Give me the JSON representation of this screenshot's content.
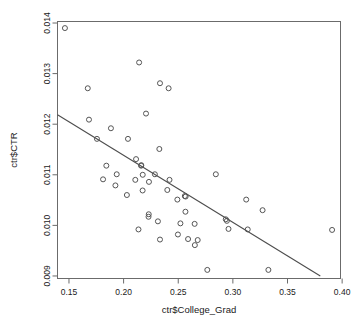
{
  "chart_data": {
    "type": "scatter",
    "title": "",
    "xlabel": "ctr$College_Grad",
    "ylabel": "ctr$CTR",
    "xlim": [
      0.1395,
      0.3985
    ],
    "ylim": [
      0.00895,
      0.01403
    ],
    "xticks": [
      0.15,
      0.2,
      0.25,
      0.3,
      0.35,
      0.4
    ],
    "xtick_labels": [
      "0.15",
      "0.20",
      "0.25",
      "0.30",
      "0.35",
      "0.40"
    ],
    "yticks": [
      0.009,
      0.01,
      0.011,
      0.012,
      0.013,
      0.014
    ],
    "ytick_labels": [
      "0.009",
      "0.010",
      "0.011",
      "0.012",
      "0.013",
      "0.014"
    ],
    "grid": false,
    "legend": null,
    "marker": "open-circle",
    "marker_color": "#555555",
    "point_count": 62,
    "points": [
      [
        0.1463,
        0.0139
      ],
      [
        0.2142,
        0.01322
      ],
      [
        0.1672,
        0.01271
      ],
      [
        0.2333,
        0.01281
      ],
      [
        0.2412,
        0.01271
      ],
      [
        0.2205,
        0.01221
      ],
      [
        0.1683,
        0.01209
      ],
      [
        0.1884,
        0.01192
      ],
      [
        0.1756,
        0.01171
      ],
      [
        0.204,
        0.01171
      ],
      [
        0.2327,
        0.01151
      ],
      [
        0.2114,
        0.01131
      ],
      [
        0.1842,
        0.01118
      ],
      [
        0.2162,
        0.01119
      ],
      [
        0.216,
        0.01118
      ],
      [
        0.1937,
        0.01101
      ],
      [
        0.2175,
        0.011
      ],
      [
        0.2286,
        0.01101
      ],
      [
        0.2844,
        0.01101
      ],
      [
        0.1812,
        0.01091
      ],
      [
        0.2107,
        0.0109
      ],
      [
        0.2232,
        0.01086
      ],
      [
        0.242,
        0.0109
      ],
      [
        0.1925,
        0.01079
      ],
      [
        0.24,
        0.0107
      ],
      [
        0.2174,
        0.01069
      ],
      [
        0.203,
        0.0106
      ],
      [
        0.256,
        0.01058
      ],
      [
        0.2568,
        0.01057
      ],
      [
        0.3122,
        0.01051
      ],
      [
        0.2492,
        0.01051
      ],
      [
        0.3272,
        0.0103
      ],
      [
        0.2566,
        0.01027
      ],
      [
        0.223,
        0.01022
      ],
      [
        0.2228,
        0.01017
      ],
      [
        0.2935,
        0.01012
      ],
      [
        0.2945,
        0.01009
      ],
      [
        0.2314,
        0.01008
      ],
      [
        0.252,
        0.01004
      ],
      [
        0.265,
        0.01003
      ],
      [
        0.2136,
        0.00992
      ],
      [
        0.296,
        0.00993
      ],
      [
        0.3136,
        0.00992
      ],
      [
        0.3908,
        0.00991
      ],
      [
        0.2497,
        0.00982
      ],
      [
        0.259,
        0.00973
      ],
      [
        0.2333,
        0.00972
      ],
      [
        0.2678,
        0.00971
      ],
      [
        0.2652,
        0.00961
      ],
      [
        0.2766,
        0.00912
      ],
      [
        0.3325,
        0.00912
      ]
    ],
    "fit_line": {
      "x_start": 0.1395,
      "y_start": 0.012185,
      "x_end": 0.38,
      "y_end": 0.009,
      "color": "#4d4d4d"
    }
  }
}
